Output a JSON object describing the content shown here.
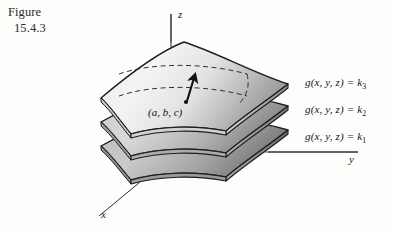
{
  "figure": {
    "caption_line_1": "Figure",
    "caption_line_2": "15.4.3"
  },
  "axes": {
    "z_label": "z",
    "y_label": "y",
    "x_label": "x"
  },
  "point": {
    "label": "(a, b, c)"
  },
  "gradient_vector": {
    "name": "gradient-arrow"
  },
  "level_surfaces": [
    {
      "function": "g(x, y, z) = k",
      "constant": "3",
      "label_full": "g(x, y, z) = k3",
      "position": "top"
    },
    {
      "function": "g(x, y, z) = k",
      "constant": "2",
      "label_full": "g(x, y, z) = k2",
      "position": "middle"
    },
    {
      "function": "g(x, y, z) = k",
      "constant": "1",
      "label_full": "g(x, y, z) = k1",
      "position": "bottom"
    }
  ],
  "colors": {
    "ink": "#1a1a1a",
    "surface_light": "#f2f2f0",
    "surface_mid": "#bdbdbb",
    "surface_dark": "#8d8d8b",
    "surface_darkest": "#6f6f6d",
    "paper": "#fdfdfb",
    "axis_line": "#3a3a3a"
  }
}
